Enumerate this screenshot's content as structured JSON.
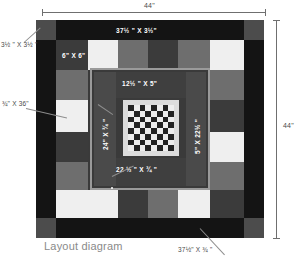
{
  "caption": "Layout diagram",
  "dimensions": {
    "top_width": "44\"",
    "right_height": "44\""
  },
  "labels": {
    "corner_square": "3½ \" X 3½ \"",
    "left_strip": "¾\" X 36\"",
    "top_border": "37½ \" X 3½\"",
    "ring_square": "6\" X 6\"",
    "mid_top_strip": "12½ \" X 5\"",
    "mid_left_strip": "24\" X ¾ \"",
    "mid_right_strip": "5\" X 22½ \"",
    "mid_bottom_strip": "22 ½ \" X ¾ \"",
    "bottom_border": "37½\" X ¾ \""
  },
  "colors": {
    "outer_border": "#141414",
    "corner_block": "#4c4c4c",
    "dark_square": "#3b3b3b",
    "medium_square": "#6e6e6e",
    "light_square": "#efefef",
    "sashing": "#9a9a9a",
    "center_frame": "#dcdcdc",
    "checker_dark": "#232323",
    "checker_light": "#ededed",
    "dimension_line": "#6f6f6f",
    "annotation_text": "#ffffff",
    "caption_text": "#8a8a8a"
  },
  "chart_data": {
    "type": "table",
    "title": "Layout diagram",
    "ring_squares_top": [
      "dark",
      "light",
      "medium",
      "dark",
      "medium",
      "light"
    ],
    "ring_squares_bottom": [
      "light",
      "dark",
      "medium",
      "light",
      "dark",
      "medium"
    ],
    "ring_squares_left": [
      "dark",
      "medium",
      "light",
      "dark",
      "medium",
      "light"
    ],
    "ring_squares_right": [
      "medium",
      "dark",
      "medium",
      "light",
      "dark",
      "light"
    ],
    "checker_rows": 8,
    "checker_cols": 8
  }
}
